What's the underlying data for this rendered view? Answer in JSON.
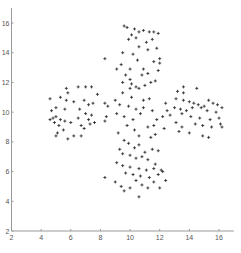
{
  "chart_data": {
    "type": "scatter",
    "title": "",
    "xlabel": "",
    "ylabel": "",
    "xlim": [
      2,
      17
    ],
    "ylim": [
      2,
      17
    ],
    "grid": false,
    "legend": null,
    "marker": "+",
    "marker_color": "#333333",
    "axis_color": "#999999",
    "x_ticks": [
      2,
      4,
      6,
      8,
      10,
      12,
      14,
      16
    ],
    "y_ticks": [
      2,
      4,
      6,
      8,
      10,
      12,
      14,
      16
    ],
    "series": [
      {
        "name": "points",
        "points": [
          [
            9.6,
            15.8
          ],
          [
            9.8,
            15.7
          ],
          [
            10.3,
            15.6
          ],
          [
            10.6,
            15.4
          ],
          [
            10.9,
            15.5
          ],
          [
            11.3,
            15.4
          ],
          [
            11.6,
            15.4
          ],
          [
            11.9,
            15.3
          ],
          [
            10.1,
            15.2
          ],
          [
            9.9,
            14.9
          ],
          [
            10.4,
            15.0
          ],
          [
            11.1,
            14.7
          ],
          [
            11.5,
            14.9
          ],
          [
            10.6,
            14.4
          ],
          [
            11.2,
            14.2
          ],
          [
            11.8,
            14.3
          ],
          [
            12.0,
            13.6
          ],
          [
            9.5,
            14.0
          ],
          [
            10.2,
            13.9
          ],
          [
            10.5,
            13.5
          ],
          [
            11.6,
            13.4
          ],
          [
            12.0,
            13.3
          ],
          [
            9.4,
            13.2
          ],
          [
            10.0,
            12.9
          ],
          [
            10.9,
            12.9
          ],
          [
            11.2,
            12.6
          ],
          [
            11.9,
            12.8
          ],
          [
            8.3,
            13.6
          ],
          [
            9.1,
            12.9
          ],
          [
            9.7,
            12.5
          ],
          [
            10.0,
            12.2
          ],
          [
            10.8,
            12.5
          ],
          [
            11.4,
            12.0
          ],
          [
            11.7,
            12.1
          ],
          [
            9.5,
            12.0
          ],
          [
            10.1,
            11.9
          ],
          [
            10.4,
            11.7
          ],
          [
            11.0,
            11.8
          ],
          [
            4.6,
            10.9
          ],
          [
            5.3,
            11.0
          ],
          [
            4.7,
            10.1
          ],
          [
            5.0,
            10.3
          ],
          [
            5.6,
            10.2
          ],
          [
            4.8,
            9.6
          ],
          [
            5.0,
            9.7
          ],
          [
            5.3,
            9.5
          ],
          [
            5.6,
            9.4
          ],
          [
            4.9,
            9.3
          ],
          [
            5.2,
            9.1
          ],
          [
            6.0,
            9.3
          ],
          [
            5.5,
            8.8
          ],
          [
            5.1,
            8.6
          ],
          [
            5.0,
            8.4
          ],
          [
            5.8,
            8.2
          ],
          [
            6.2,
            8.4
          ],
          [
            6.7,
            8.4
          ],
          [
            5.7,
            11.6
          ],
          [
            5.8,
            11.3
          ],
          [
            6.5,
            11.7
          ],
          [
            7.4,
            11.7
          ],
          [
            7.0,
            11.7
          ],
          [
            7.8,
            11.2
          ],
          [
            6.2,
            10.7
          ],
          [
            6.9,
            10.8
          ],
          [
            7.2,
            10.5
          ],
          [
            7.5,
            10.6
          ],
          [
            8.3,
            10.6
          ],
          [
            8.5,
            10.4
          ],
          [
            6.6,
            10.2
          ],
          [
            7.0,
            9.9
          ],
          [
            7.4,
            9.8
          ],
          [
            6.5,
            9.6
          ],
          [
            7.2,
            9.5
          ],
          [
            7.6,
            9.3
          ],
          [
            8.4,
            9.7
          ],
          [
            6.7,
            9.1
          ],
          [
            6.9,
            8.9
          ],
          [
            7.3,
            9.2
          ],
          [
            8.3,
            9.4
          ],
          [
            5.7,
            10.8
          ],
          [
            4.6,
            9.5
          ],
          [
            9.0,
            10.8
          ],
          [
            9.5,
            11.3
          ],
          [
            10.0,
            11.6
          ],
          [
            10.1,
            11.0
          ],
          [
            10.6,
            11.6
          ],
          [
            10.9,
            10.8
          ],
          [
            11.3,
            10.9
          ],
          [
            9.3,
            10.5
          ],
          [
            9.9,
            10.4
          ],
          [
            10.4,
            10.2
          ],
          [
            10.9,
            10.3
          ],
          [
            11.5,
            10.1
          ],
          [
            9.1,
            9.9
          ],
          [
            9.6,
            9.7
          ],
          [
            10.2,
            9.5
          ],
          [
            10.7,
            9.9
          ],
          [
            11.8,
            9.5
          ],
          [
            12.2,
            9.7
          ],
          [
            12.4,
            10.6
          ],
          [
            12.5,
            10.1
          ],
          [
            9.8,
            9.1
          ],
          [
            10.3,
            8.8
          ],
          [
            11.2,
            9.0
          ],
          [
            11.6,
            9.1
          ],
          [
            12.3,
            8.9
          ],
          [
            9.2,
            8.6
          ],
          [
            10.6,
            8.4
          ],
          [
            11.4,
            8.3
          ],
          [
            11.7,
            8.5
          ],
          [
            13.2,
            11.4
          ],
          [
            13.6,
            11.7
          ],
          [
            13.6,
            11.3
          ],
          [
            14.5,
            11.6
          ],
          [
            13.1,
            10.9
          ],
          [
            13.6,
            10.8
          ],
          [
            14.0,
            10.7
          ],
          [
            14.3,
            10.6
          ],
          [
            14.6,
            10.5
          ],
          [
            15.0,
            10.4
          ],
          [
            15.3,
            10.8
          ],
          [
            15.6,
            10.6
          ],
          [
            15.9,
            10.5
          ],
          [
            13.0,
            10.3
          ],
          [
            13.4,
            10.2
          ],
          [
            13.8,
            10.1
          ],
          [
            14.2,
            10.3
          ],
          [
            14.8,
            10.3
          ],
          [
            15.2,
            10.1
          ],
          [
            15.8,
            10.0
          ],
          [
            16.2,
            10.3
          ],
          [
            12.7,
            9.8
          ],
          [
            13.5,
            9.9
          ],
          [
            14.1,
            9.7
          ],
          [
            14.7,
            9.6
          ],
          [
            15.4,
            9.5
          ],
          [
            16.0,
            9.6
          ],
          [
            13.1,
            9.3
          ],
          [
            13.5,
            9.0
          ],
          [
            14.4,
            9.2
          ],
          [
            14.9,
            9.1
          ],
          [
            15.5,
            9.0
          ],
          [
            16.1,
            9.2
          ],
          [
            13.3,
            8.7
          ],
          [
            14.0,
            8.6
          ],
          [
            14.9,
            8.4
          ],
          [
            15.3,
            8.3
          ],
          [
            16.2,
            9.0
          ],
          [
            9.6,
            8.1
          ],
          [
            9.9,
            7.9
          ],
          [
            10.3,
            7.6
          ],
          [
            10.6,
            7.8
          ],
          [
            11.0,
            7.3
          ],
          [
            11.5,
            7.5
          ],
          [
            11.9,
            7.4
          ],
          [
            9.3,
            7.5
          ],
          [
            9.5,
            7.2
          ],
          [
            10.0,
            7.1
          ],
          [
            10.4,
            6.9
          ],
          [
            10.8,
            7.0
          ],
          [
            11.2,
            6.8
          ],
          [
            11.7,
            6.5
          ],
          [
            9.1,
            6.6
          ],
          [
            9.5,
            6.4
          ],
          [
            10.0,
            6.3
          ],
          [
            10.6,
            6.2
          ],
          [
            11.1,
            6.1
          ],
          [
            11.6,
            6.2
          ],
          [
            12.1,
            6.1
          ],
          [
            9.7,
            5.9
          ],
          [
            10.2,
            5.8
          ],
          [
            10.7,
            5.7
          ],
          [
            11.3,
            5.6
          ],
          [
            11.9,
            5.8
          ],
          [
            12.2,
            6.0
          ],
          [
            8.3,
            5.6
          ],
          [
            9.0,
            5.3
          ],
          [
            9.4,
            5.0
          ],
          [
            10.0,
            4.9
          ],
          [
            10.4,
            5.4
          ],
          [
            10.8,
            5.1
          ],
          [
            11.2,
            4.9
          ],
          [
            11.6,
            5.3
          ],
          [
            12.0,
            4.9
          ],
          [
            9.6,
            4.7
          ],
          [
            10.6,
            4.3
          ],
          [
            12.4,
            5.4
          ]
        ]
      }
    ]
  }
}
